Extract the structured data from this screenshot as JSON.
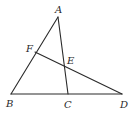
{
  "diagram": {
    "type": "geometry-triangle",
    "points": {
      "A": {
        "label": "A",
        "x": 58,
        "y": 17,
        "label_x": 55,
        "label_y": 13
      },
      "B": {
        "label": "B",
        "x": 11,
        "y": 94,
        "label_x": 6,
        "label_y": 107
      },
      "C": {
        "label": "C",
        "x": 68,
        "y": 94,
        "label_x": 64,
        "label_y": 108
      },
      "D": {
        "label": "D",
        "x": 122,
        "y": 94,
        "label_x": 120,
        "label_y": 108
      },
      "E": {
        "label": "E",
        "x": 64,
        "y": 66,
        "label_x": 67,
        "label_y": 64
      },
      "F": {
        "label": "F",
        "x": 35,
        "y": 52,
        "label_x": 26,
        "label_y": 52
      }
    },
    "segments": [
      {
        "from": "A",
        "to": "B"
      },
      {
        "from": "A",
        "to": "C"
      },
      {
        "from": "B",
        "to": "D"
      },
      {
        "from": "F",
        "to": "D"
      }
    ],
    "line_color": "#2a2a2a"
  }
}
